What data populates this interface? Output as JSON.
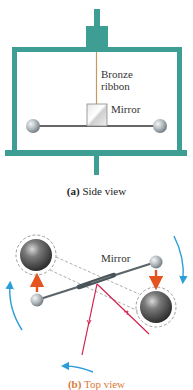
{
  "figure": {
    "side_view": {
      "ribbon_label_line1": "Bronze",
      "ribbon_label_line2": "ribbon",
      "mirror_label": "Mirror",
      "caption_letter": "(a)",
      "caption_text": " Side view"
    },
    "top_view": {
      "mirror_label": "Mirror",
      "caption_letter": "(b)",
      "caption_text": " Top view"
    },
    "colors": {
      "frame": "#3f9e93",
      "frame_dark": "#2f7f76",
      "ribbon": "#c89a5a",
      "rod": "#666666",
      "force_arrow": "#e5531e",
      "rotation_arrow": "#2b9ed8",
      "light_ray": "#d2204f",
      "dashed": "#777777"
    }
  }
}
